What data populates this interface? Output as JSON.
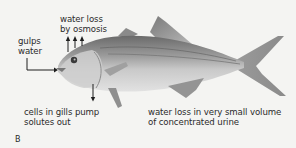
{
  "figure": {
    "panel_letter": "B"
  },
  "labels": {
    "gulps_water": [
      "gulps",
      "water"
    ],
    "water_loss_osmosis": [
      "water loss",
      "by osmosis"
    ],
    "gills_pump": [
      "cells in gills pump",
      "solutes out"
    ],
    "urine": [
      "water loss in very small volume",
      "of concentrated urine"
    ]
  },
  "arrows": {
    "gulps_water": {
      "direction": "right",
      "count": 1
    },
    "water_loss_osmosis": {
      "direction": "up",
      "count": 3
    },
    "gills_pump": {
      "direction": "down",
      "count": 1
    }
  },
  "colors": {
    "background": "#f4f4f2",
    "text": "#2b2b2b",
    "fish_dark": "#6e6e6e",
    "fish_light": "#d8d8d8",
    "arrow": "#1e1e1e"
  }
}
